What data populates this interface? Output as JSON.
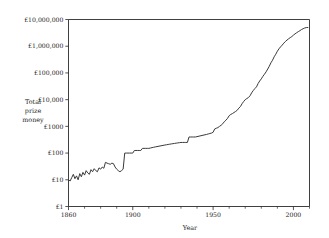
{
  "chart_data": {
    "type": "line",
    "title": "",
    "xlabel": "Year",
    "ylabel": "Total prize money",
    "ylabel_lines": [
      "Total",
      "prize",
      "money"
    ],
    "yscale": "log",
    "xscale": "linear",
    "grid": false,
    "legend": null,
    "xlim": [
      1860,
      2010
    ],
    "ylim": [
      1,
      10000000
    ],
    "ytick_values": [
      1,
      10,
      100,
      1000,
      10000,
      100000,
      1000000,
      10000000
    ],
    "ytick_labels": [
      "£1",
      "£10",
      "£100",
      "£1000",
      "£10,000",
      "£100,000",
      "£1,000,000",
      "£10,000,000"
    ],
    "xtick_values": [
      1860,
      1900,
      1950,
      2000
    ],
    "xtick_labels": [
      "1860",
      "1900",
      "1950",
      "2000"
    ],
    "xminor_step": 10,
    "line_color": "#3a3a3a",
    "axis_color": "#2a2a2a",
    "background_color": "#ffffff",
    "series": [
      {
        "name": "Total prize money",
        "x": [
          1860,
          1861,
          1862,
          1863,
          1864,
          1865,
          1866,
          1867,
          1868,
          1869,
          1870,
          1871,
          1872,
          1873,
          1874,
          1875,
          1876,
          1877,
          1878,
          1879,
          1880,
          1881,
          1882,
          1883,
          1884,
          1885,
          1886,
          1887,
          1888,
          1889,
          1890,
          1891,
          1892,
          1893,
          1894,
          1895,
          1896,
          1897,
          1898,
          1899,
          1900,
          1901,
          1902,
          1903,
          1904,
          1905,
          1906,
          1907,
          1908,
          1909,
          1910,
          1911,
          1912,
          1913,
          1914,
          1920,
          1921,
          1922,
          1923,
          1924,
          1925,
          1926,
          1927,
          1928,
          1929,
          1930,
          1931,
          1932,
          1933,
          1934,
          1935,
          1936,
          1937,
          1938,
          1939,
          1946,
          1947,
          1948,
          1949,
          1950,
          1951,
          1952,
          1953,
          1954,
          1955,
          1956,
          1957,
          1958,
          1959,
          1960,
          1961,
          1962,
          1963,
          1964,
          1965,
          1966,
          1967,
          1968,
          1969,
          1970,
          1971,
          1972,
          1973,
          1974,
          1975,
          1976,
          1977,
          1978,
          1979,
          1980,
          1981,
          1982,
          1983,
          1984,
          1985,
          1986,
          1987,
          1988,
          1989,
          1990,
          1991,
          1992,
          1993,
          1994,
          1995,
          1996,
          1997,
          1998,
          1999,
          2000,
          2001,
          2002,
          2003,
          2004,
          2005,
          2006,
          2007,
          2008,
          2009
        ],
        "y": [
          10,
          9,
          12,
          16,
          11,
          14,
          10,
          17,
          13,
          19,
          15,
          22,
          18,
          16,
          24,
          20,
          26,
          22,
          20,
          28,
          25,
          30,
          27,
          45,
          42,
          40,
          38,
          42,
          40,
          30,
          25,
          22,
          20,
          22,
          25,
          100,
          100,
          100,
          100,
          100,
          100,
          125,
          125,
          125,
          125,
          125,
          150,
          150,
          150,
          150,
          150,
          155,
          160,
          165,
          170,
          200,
          205,
          210,
          215,
          220,
          225,
          230,
          235,
          240,
          245,
          250,
          250,
          250,
          250,
          250,
          400,
          400,
          400,
          400,
          400,
          500,
          520,
          540,
          560,
          600,
          800,
          850,
          900,
          1000,
          1100,
          1250,
          1500,
          1700,
          2000,
          2500,
          2800,
          3000,
          3300,
          3600,
          4000,
          4800,
          5500,
          7000,
          8500,
          10000,
          11000,
          12000,
          14000,
          18000,
          22000,
          26000,
          30000,
          40000,
          50000,
          60000,
          75000,
          90000,
          110000,
          140000,
          180000,
          240000,
          300000,
          400000,
          500000,
          650000,
          800000,
          950000,
          1100000,
          1300000,
          1500000,
          1700000,
          1900000,
          2100000,
          2300000,
          2600000,
          2900000,
          3200000,
          3500000,
          3800000,
          4200000,
          4500000,
          4800000,
          5000000,
          5000000
        ]
      }
    ]
  }
}
